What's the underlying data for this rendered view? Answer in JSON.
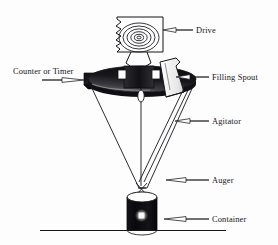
{
  "diagram": {
    "background_color": "#fdfdfd",
    "ink_color": "#15151a",
    "ground_line": {
      "x1": 40,
      "y1": 230,
      "x2": 226,
      "y2": 230
    }
  },
  "labels": {
    "drive": "Drive",
    "counter_or_timer": "Counter or Timer",
    "filling_spout": "Filling Spout",
    "agitator": "Agitator",
    "auger": "Auger",
    "container": "Container"
  },
  "parts": [
    {
      "id": "drive",
      "label": "Drive",
      "label_x": 196,
      "label_y": 33,
      "leader_from": [
        193,
        30
      ],
      "leader_to": [
        163,
        30
      ],
      "description": "motor housing with concentric coil rings and torn left edge"
    },
    {
      "id": "counter-or-timer",
      "label": "Counter or Timer",
      "label_x": 13,
      "label_y": 74,
      "leader_from": [
        42,
        80
      ],
      "leader_to": [
        84,
        80
      ],
      "description": "dark horizontal control block at hopper rim left"
    },
    {
      "id": "filling-spout",
      "label": "Filling Spout",
      "label_x": 212,
      "label_y": 80,
      "leader_from": [
        209,
        77
      ],
      "leader_to": [
        176,
        77
      ],
      "description": "tilted white chute above hopper rim right"
    },
    {
      "id": "agitator",
      "label": "Agitator",
      "label_x": 212,
      "label_y": 124,
      "leader_from": [
        209,
        121
      ],
      "leader_to": [
        175,
        121
      ],
      "description": "diagonal twin-line stirring rod inside cone"
    },
    {
      "id": "auger",
      "label": "Auger",
      "label_x": 212,
      "label_y": 183,
      "leader_from": [
        209,
        180
      ],
      "leader_to": [
        166,
        180
      ],
      "description": "screw feed at the cone outlet tip"
    },
    {
      "id": "container",
      "label": "Container",
      "label_x": 212,
      "label_y": 222,
      "leader_from": [
        209,
        219
      ],
      "leader_to": [
        164,
        219
      ],
      "description": "black cylindrical vessel resting on the ground line"
    }
  ]
}
